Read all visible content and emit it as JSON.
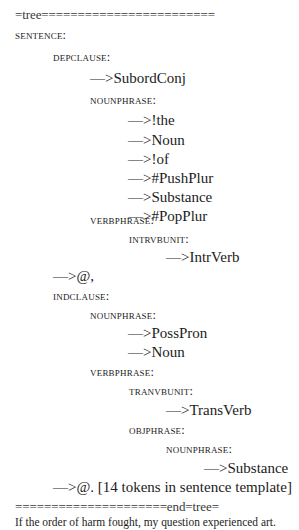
{
  "document": {
    "header_rule": "=tree========================",
    "lines": [
      {
        "kind": "label",
        "level": 0,
        "text": "SENTENCE:"
      },
      {
        "kind": "label",
        "level": 1,
        "text": "DEPCLAUSE:"
      },
      {
        "kind": "term",
        "level": 2,
        "text": "—>SubordConj"
      },
      {
        "kind": "label",
        "level": 2,
        "text": "NOUNPHRASE:"
      },
      {
        "kind": "term",
        "level": 3,
        "text": "—>!the"
      },
      {
        "kind": "term",
        "level": 3,
        "text": "—>Noun"
      },
      {
        "kind": "term",
        "level": 3,
        "text": "—>!of"
      },
      {
        "kind": "term",
        "level": 3,
        "text": "—>#PushPlur"
      },
      {
        "kind": "term",
        "level": 3,
        "text": "—>Substance"
      },
      {
        "kind": "term",
        "level": 3,
        "text": "—>#PopPlur"
      },
      {
        "kind": "label",
        "level": 2,
        "text": "VERBPHRASE:"
      },
      {
        "kind": "label",
        "level": 3,
        "text": "INTRVBUNIT:"
      },
      {
        "kind": "term",
        "level": 4,
        "text": "—>IntrVerb"
      },
      {
        "kind": "term",
        "level": 1,
        "text": "—>@,"
      },
      {
        "kind": "label",
        "level": 1,
        "text": "INDCLAUSE:"
      },
      {
        "kind": "label",
        "level": 2,
        "text": "NOUNPHRASE:"
      },
      {
        "kind": "term",
        "level": 3,
        "text": "—>PossPron"
      },
      {
        "kind": "term",
        "level": 3,
        "text": "—>Noun"
      },
      {
        "kind": "label",
        "level": 2,
        "text": "VERBPHRASE:"
      },
      {
        "kind": "label",
        "level": 3,
        "text": "TRANVBUNIT:"
      },
      {
        "kind": "term",
        "level": 4,
        "text": "—>TransVerb"
      },
      {
        "kind": "label",
        "level": 3,
        "text": "OBJPHRASE:"
      },
      {
        "kind": "label",
        "level": 4,
        "text": "NOUNPHRASE:"
      },
      {
        "kind": "term",
        "level": 5,
        "text": "—>Substance"
      },
      {
        "kind": "term",
        "level": 1,
        "text": "—>@. [14 tokens in sentence template]"
      }
    ],
    "footer_rule": "=====================end=tree=",
    "generated_sentence": "If the order of harm fought, my question experienced art."
  }
}
